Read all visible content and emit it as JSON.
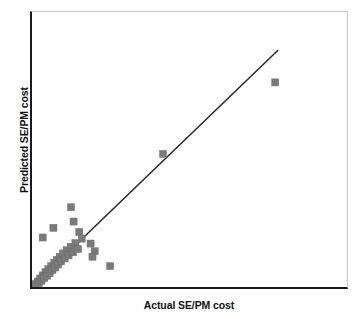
{
  "chart_data": {
    "type": "scatter",
    "title": "",
    "xlabel": "Actual SE/PM cost",
    "ylabel": "Predicted SE/PM cost",
    "xlim": [
      0,
      100
    ],
    "ylim": [
      0,
      100
    ],
    "grid": false,
    "legend": false,
    "marker_shape": "square",
    "marker_color": "#7a7a7a",
    "line_color": "#262626",
    "axis_color": "#1a1a1a",
    "tick_labels_x": [],
    "tick_labels_y": [],
    "reference_line": {
      "name": "identity-fit-line",
      "x": [
        0,
        78
      ],
      "y": [
        0,
        86
      ]
    },
    "points": [
      {
        "x": 0.6,
        "y": 0.7
      },
      {
        "x": 1.2,
        "y": 1.1
      },
      {
        "x": 1.8,
        "y": 2.0
      },
      {
        "x": 2.2,
        "y": 1.4
      },
      {
        "x": 2.6,
        "y": 3.1
      },
      {
        "x": 3.0,
        "y": 2.3
      },
      {
        "x": 3.4,
        "y": 4.2
      },
      {
        "x": 3.9,
        "y": 3.3
      },
      {
        "x": 4.3,
        "y": 5.4
      },
      {
        "x": 4.8,
        "y": 4.1
      },
      {
        "x": 5.2,
        "y": 6.5
      },
      {
        "x": 5.6,
        "y": 5.0
      },
      {
        "x": 6.1,
        "y": 7.6
      },
      {
        "x": 6.5,
        "y": 6.2
      },
      {
        "x": 7.0,
        "y": 8.8
      },
      {
        "x": 7.4,
        "y": 7.1
      },
      {
        "x": 7.9,
        "y": 9.9
      },
      {
        "x": 8.3,
        "y": 8.2
      },
      {
        "x": 8.8,
        "y": 11.0
      },
      {
        "x": 9.2,
        "y": 9.3
      },
      {
        "x": 9.8,
        "y": 12.2
      },
      {
        "x": 10.4,
        "y": 10.4
      },
      {
        "x": 11.0,
        "y": 13.4
      },
      {
        "x": 11.6,
        "y": 11.5
      },
      {
        "x": 12.3,
        "y": 14.6
      },
      {
        "x": 13.0,
        "y": 12.6
      },
      {
        "x": 13.8,
        "y": 16.0
      },
      {
        "x": 14.6,
        "y": 13.8
      },
      {
        "x": 6.8,
        "y": 21.5
      },
      {
        "x": 3.4,
        "y": 18.0
      },
      {
        "x": 12.4,
        "y": 29.0
      },
      {
        "x": 13.2,
        "y": 23.8
      },
      {
        "x": 15.0,
        "y": 20.0
      },
      {
        "x": 15.8,
        "y": 17.6
      },
      {
        "x": 18.6,
        "y": 15.8
      },
      {
        "x": 19.9,
        "y": 13.0
      },
      {
        "x": 19.2,
        "y": 11.0
      },
      {
        "x": 24.8,
        "y": 7.6
      },
      {
        "x": 41.6,
        "y": 48.4
      },
      {
        "x": 77.2,
        "y": 74.4
      }
    ]
  }
}
